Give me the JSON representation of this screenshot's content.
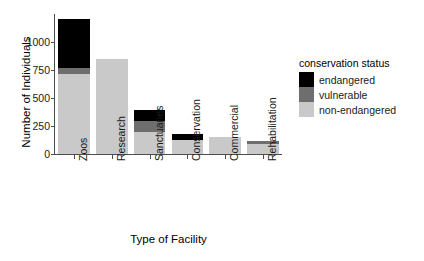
{
  "chart_data": {
    "type": "bar",
    "subtype": "stacked-bar",
    "title": "",
    "xlabel": "Type of Facility",
    "ylabel": "Number of Individuals",
    "categories": [
      "Zoos",
      "Research",
      "Sanctuaries",
      "Conservation",
      "Commercial",
      "Rehabilitation"
    ],
    "series": [
      {
        "name": "non-endangered",
        "color": "#c9c9c9",
        "values": [
          710,
          850,
          195,
          125,
          150,
          85
        ]
      },
      {
        "name": "vulnerable",
        "color": "#6e6e6e",
        "values": [
          60,
          0,
          100,
          0,
          0,
          30
        ]
      },
      {
        "name": "endangered",
        "color": "#000000",
        "values": [
          440,
          0,
          95,
          50,
          0,
          0
        ]
      }
    ],
    "totals": [
      1210,
      850,
      390,
      175,
      150,
      115
    ],
    "ylim": [
      0,
      1250
    ],
    "yticks": [
      0,
      250,
      500,
      750,
      1000
    ],
    "ytick_labels": [
      "0",
      "250",
      "500",
      "750",
      "1000"
    ],
    "grid": false,
    "legend": {
      "title": "conservation status",
      "position": "right",
      "entries": [
        {
          "label": "endangered",
          "color": "#000000"
        },
        {
          "label": "vulnerable",
          "color": "#6e6e6e"
        },
        {
          "label": "non-endangered",
          "color": "#c9c9c9"
        }
      ]
    },
    "stack_order_bottom_to_top": [
      "non-endangered",
      "vulnerable",
      "endangered"
    ],
    "axis_color": "#4d4d4d",
    "background": "#ffffff"
  }
}
